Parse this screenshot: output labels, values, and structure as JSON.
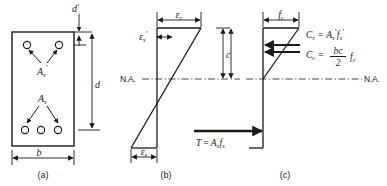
{
  "figure": {
    "background_color": "#ffffff",
    "line_color": "#1a1a1a",
    "width": 387,
    "height": 186
  },
  "panels": [
    {
      "key": "a",
      "label": "(a)",
      "caption": "beam cross section",
      "dimensions": [
        {
          "name": "d-prime",
          "symbol": "d",
          "prime": "′",
          "description": "distance from top fiber to compression steel centroid"
        },
        {
          "name": "d",
          "symbol": "d",
          "prime": "",
          "description": "effective depth to tension steel centroid"
        },
        {
          "name": "b",
          "symbol": "b",
          "prime": "",
          "description": "section width"
        }
      ],
      "rebar_labels": [
        {
          "name": "compression-steel",
          "symbol": "A",
          "sub": "s",
          "prime": "′",
          "bar_count": 2
        },
        {
          "name": "tension-steel",
          "symbol": "A",
          "sub": "s",
          "prime": "",
          "bar_count": 3
        }
      ]
    },
    {
      "key": "b",
      "label": "(b)",
      "caption": "strain diagram",
      "neutral_axis_label": "N.A.",
      "labels": [
        {
          "name": "concrete-strain",
          "symbol": "ε",
          "sub": "c",
          "prime": ""
        },
        {
          "name": "compression-steel-strain",
          "symbol": "ε",
          "sub": "s",
          "prime": "′"
        },
        {
          "name": "tension-steel-strain",
          "symbol": "ε",
          "sub": "s",
          "prime": ""
        }
      ],
      "depth_label": {
        "name": "neutral-axis-depth",
        "symbol": "c"
      },
      "force_equation": {
        "name": "tension-force",
        "lhs": "T",
        "op": "=",
        "rhs_symbol": "A",
        "rhs_sub": "s",
        "rhs_symbol2": "f",
        "rhs_sub2": "s",
        "plain": "T = As fs"
      }
    },
    {
      "key": "c",
      "label": "(c)",
      "caption": "stress diagram",
      "neutral_axis_label": "N.A.",
      "labels": [
        {
          "name": "concrete-stress",
          "symbol": "f",
          "sub": "c",
          "prime": ""
        }
      ],
      "depth_label": {
        "name": "neutral-axis-depth",
        "symbol": "c"
      },
      "equations": [
        {
          "name": "compression-steel-force",
          "lhs": "C",
          "lhs_sub": "s",
          "op": "=",
          "plain": "Cs = A′s f′s",
          "terms": [
            {
              "symbol": "A",
              "sub": "s",
              "prime": "′"
            },
            {
              "symbol": "f",
              "sub": "s",
              "prime": "′"
            }
          ]
        },
        {
          "name": "concrete-compression-force",
          "lhs": "C",
          "lhs_sub": "c",
          "op": "=",
          "plain": "Cc = (bc/2) fc",
          "fraction": {
            "numerator": "bc",
            "denominator": "2"
          },
          "terms": [
            {
              "symbol": "f",
              "sub": "c",
              "prime": ""
            }
          ]
        }
      ]
    }
  ]
}
